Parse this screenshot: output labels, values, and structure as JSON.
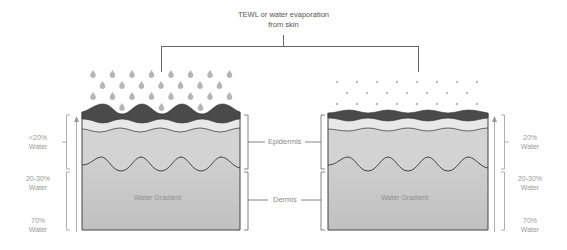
{
  "title": {
    "line1": "TEWL or water evaporation",
    "line2": "from skin"
  },
  "layers": {
    "epidermis": "Epidermis",
    "dermis": "Dermis"
  },
  "left_skin": {
    "gradient_label": "Water Gradient",
    "water_levels": [
      {
        "pct": "<20%",
        "unit": "Water"
      },
      {
        "pct": "20-30%",
        "unit": "Water"
      },
      {
        "pct": "70%",
        "unit": "Water"
      }
    ],
    "evaporation": "heavy",
    "droplet_icon": "water-drop-icon"
  },
  "right_skin": {
    "gradient_label": "Water Gradient",
    "water_levels": [
      {
        "pct": "20%",
        "unit": "Water"
      },
      {
        "pct": "20-30%",
        "unit": "Water"
      },
      {
        "pct": "70%",
        "unit": "Water"
      }
    ],
    "evaporation": "light",
    "droplet_icon": "small-dot-icon"
  },
  "colors": {
    "stratum_dark": "#4a4a4a",
    "band_light": "#e4e4e4",
    "epidermis_gray": "#cdcdcd",
    "dermis_top": "#d6d6d6",
    "dermis_bottom": "#c2c2c2",
    "line": "#555555",
    "droplet": "#b3b3b3"
  }
}
